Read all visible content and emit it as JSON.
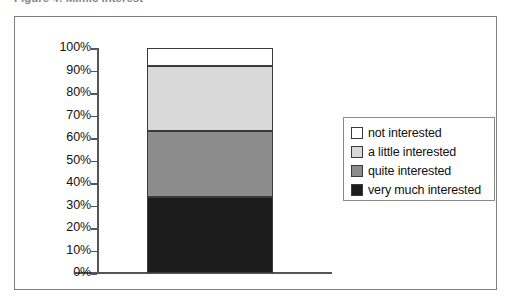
{
  "caption": {
    "text": "Figure 4: Mimic interest",
    "clipped": true
  },
  "chart_data": {
    "type": "bar",
    "subtype": "stacked-bar-100-percent",
    "title": "",
    "xlabel": "",
    "ylabel": "",
    "categories": [
      ""
    ],
    "ylim": [
      0,
      100
    ],
    "grid": false,
    "legend_position": "right",
    "y_ticks": [
      "0%",
      "10%",
      "20%",
      "30%",
      "40%",
      "50%",
      "60%",
      "70%",
      "80%",
      "90%",
      "100%"
    ],
    "y_tick_values": [
      0,
      10,
      20,
      30,
      40,
      50,
      60,
      70,
      80,
      90,
      100
    ],
    "series": [
      {
        "name": "very much interested",
        "values": [
          34
        ],
        "start": 0,
        "end": 34,
        "color": "#1c1c1c"
      },
      {
        "name": "quite interested",
        "values": [
          29
        ],
        "start": 34,
        "end": 63,
        "color": "#8c8c8c"
      },
      {
        "name": "a little interested",
        "values": [
          29
        ],
        "start": 63,
        "end": 92,
        "color": "#d9d9d9"
      },
      {
        "name": "not interested",
        "values": [
          8
        ],
        "start": 92,
        "end": 100,
        "color": "#ffffff"
      }
    ]
  },
  "legend": {
    "items": [
      {
        "label": "not interested",
        "color": "#ffffff"
      },
      {
        "label": "a little interested",
        "color": "#d9d9d9"
      },
      {
        "label": "quite interested",
        "color": "#8c8c8c"
      },
      {
        "label": "very much interested",
        "color": "#1c1c1c"
      }
    ]
  },
  "colors": {
    "frame": "#7d7d7d",
    "axis": "#555555",
    "text": "#111111",
    "segment_outline": "#3a3a3a"
  }
}
